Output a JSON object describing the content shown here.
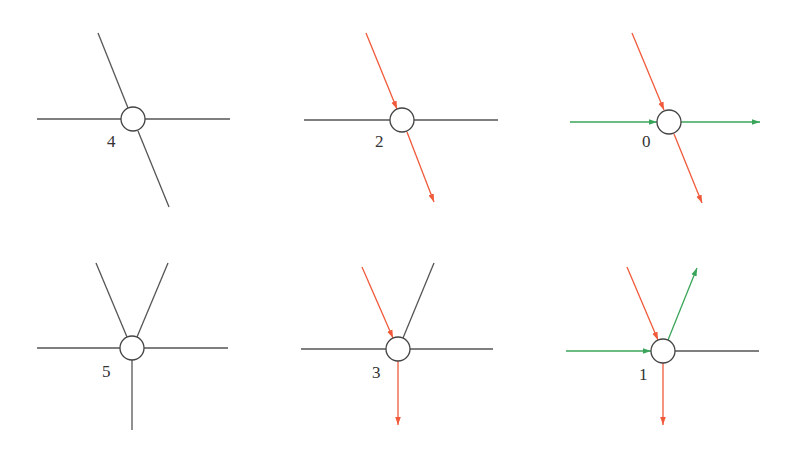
{
  "colors": {
    "neutral": "#555555",
    "red": "#f05a3a",
    "green": "#3aa55a",
    "node_stroke": "#444444"
  },
  "nodes": [
    {
      "label": "4",
      "cx": 133,
      "cy": 119,
      "lx": 107,
      "ly": 147,
      "edges": [
        {
          "x1": 37,
          "y1": 119,
          "x2": 121,
          "y2": 119,
          "color": "neutral",
          "arrow": false
        },
        {
          "x1": 145,
          "y1": 119,
          "x2": 230,
          "y2": 119,
          "color": "neutral",
          "arrow": false
        },
        {
          "x1": 98,
          "y1": 33,
          "x2": 128,
          "y2": 108,
          "color": "neutral",
          "arrow": false
        },
        {
          "x1": 138,
          "y1": 131,
          "x2": 169,
          "y2": 207,
          "color": "neutral",
          "arrow": false
        }
      ]
    },
    {
      "label": "2",
      "cx": 402,
      "cy": 120,
      "lx": 375,
      "ly": 147,
      "edges": [
        {
          "x1": 304,
          "y1": 120,
          "x2": 390,
          "y2": 120,
          "color": "neutral",
          "arrow": false
        },
        {
          "x1": 414,
          "y1": 120,
          "x2": 498,
          "y2": 120,
          "color": "neutral",
          "arrow": false
        },
        {
          "x1": 366,
          "y1": 33,
          "x2": 397,
          "y2": 109,
          "color": "red",
          "arrow": true
        },
        {
          "x1": 407,
          "y1": 132,
          "x2": 434,
          "y2": 202,
          "color": "red",
          "arrow": true
        }
      ]
    },
    {
      "label": "0",
      "cx": 669,
      "cy": 122,
      "lx": 642,
      "ly": 147,
      "edges": [
        {
          "x1": 570,
          "y1": 122,
          "x2": 657,
          "y2": 122,
          "color": "green",
          "arrow": true
        },
        {
          "x1": 681,
          "y1": 122,
          "x2": 760,
          "y2": 122,
          "color": "green",
          "arrow": true
        },
        {
          "x1": 632,
          "y1": 33,
          "x2": 664,
          "y2": 110,
          "color": "red",
          "arrow": true
        },
        {
          "x1": 674,
          "y1": 134,
          "x2": 702,
          "y2": 203,
          "color": "red",
          "arrow": true
        }
      ]
    },
    {
      "label": "5",
      "cx": 132,
      "cy": 348,
      "lx": 102,
      "ly": 377,
      "edges": [
        {
          "x1": 37,
          "y1": 348,
          "x2": 120,
          "y2": 348,
          "color": "neutral",
          "arrow": false
        },
        {
          "x1": 144,
          "y1": 348,
          "x2": 228,
          "y2": 348,
          "color": "neutral",
          "arrow": false
        },
        {
          "x1": 96,
          "y1": 263,
          "x2": 127,
          "y2": 337,
          "color": "neutral",
          "arrow": false
        },
        {
          "x1": 168,
          "y1": 263,
          "x2": 137,
          "y2": 337,
          "color": "neutral",
          "arrow": false
        },
        {
          "x1": 132,
          "y1": 360,
          "x2": 132,
          "y2": 430,
          "color": "neutral",
          "arrow": false
        }
      ]
    },
    {
      "label": "3",
      "cx": 398,
      "cy": 349,
      "lx": 372,
      "ly": 378,
      "edges": [
        {
          "x1": 301,
          "y1": 349,
          "x2": 386,
          "y2": 349,
          "color": "neutral",
          "arrow": false
        },
        {
          "x1": 410,
          "y1": 349,
          "x2": 493,
          "y2": 349,
          "color": "neutral",
          "arrow": false
        },
        {
          "x1": 362,
          "y1": 267,
          "x2": 393,
          "y2": 338,
          "color": "red",
          "arrow": true
        },
        {
          "x1": 434,
          "y1": 263,
          "x2": 403,
          "y2": 338,
          "color": "neutral",
          "arrow": false
        },
        {
          "x1": 398,
          "y1": 361,
          "x2": 398,
          "y2": 425,
          "color": "red",
          "arrow": true
        }
      ]
    },
    {
      "label": "1",
      "cx": 663,
      "cy": 351,
      "lx": 639,
      "ly": 380,
      "edges": [
        {
          "x1": 566,
          "y1": 351,
          "x2": 651,
          "y2": 351,
          "color": "green",
          "arrow": true
        },
        {
          "x1": 675,
          "y1": 351,
          "x2": 759,
          "y2": 351,
          "color": "neutral",
          "arrow": false
        },
        {
          "x1": 627,
          "y1": 267,
          "x2": 658,
          "y2": 340,
          "color": "red",
          "arrow": true
        },
        {
          "x1": 668,
          "y1": 340,
          "x2": 697,
          "y2": 268,
          "color": "green",
          "arrow": true
        },
        {
          "x1": 663,
          "y1": 363,
          "x2": 663,
          "y2": 425,
          "color": "red",
          "arrow": true
        }
      ]
    }
  ],
  "node_radius": 12
}
